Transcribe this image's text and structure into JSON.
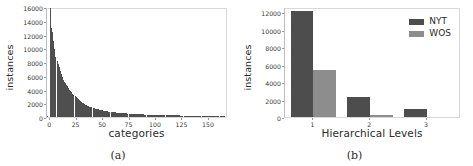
{
  "figure": {
    "background": "#ffffff",
    "subfigures": [
      {
        "caption": "(a)"
      },
      {
        "caption": "(b)"
      }
    ]
  },
  "colors": {
    "nyt": "#4d4d4d",
    "wos": "#8d8d8d",
    "histogram": "#4f4f4f",
    "axis": "#d8d8d8",
    "text": "#2b2b2b"
  },
  "chart_data": [
    {
      "type": "bar",
      "id": "category-instance-distribution",
      "title": "",
      "xlabel": "categories",
      "ylabel": "instances",
      "xlim": [
        -3,
        168
      ],
      "ylim": [
        0,
        16000
      ],
      "grid": false,
      "legend": null,
      "xticks": [
        "0",
        "25",
        "50",
        "75",
        "100",
        "125",
        "150"
      ],
      "xtick_values": [
        0,
        25,
        50,
        75,
        100,
        125,
        150
      ],
      "yticks": [
        "0",
        "2000",
        "4000",
        "6000",
        "8000",
        "10000",
        "12000",
        "14000",
        "16000"
      ],
      "ytick_values": [
        0,
        2000,
        4000,
        6000,
        8000,
        10000,
        12000,
        14000,
        16000
      ],
      "categories": [
        0,
        1,
        2,
        3,
        4,
        5,
        6,
        7,
        8,
        9,
        10,
        11,
        12,
        13,
        14,
        15,
        16,
        17,
        18,
        19,
        20,
        21,
        22,
        23,
        24,
        25,
        26,
        27,
        28,
        29,
        30,
        31,
        32,
        33,
        34,
        35,
        36,
        37,
        38,
        39,
        40,
        41,
        42,
        43,
        44,
        45,
        46,
        47,
        48,
        49,
        50,
        51,
        52,
        53,
        54,
        55,
        56,
        57,
        58,
        59,
        60,
        61,
        62,
        63,
        64,
        65,
        66,
        67,
        68,
        69,
        70,
        71,
        72,
        73,
        74,
        75,
        76,
        77,
        78,
        79,
        80,
        81,
        82,
        83,
        84,
        85,
        86,
        87,
        88,
        89,
        90,
        91,
        92,
        93,
        94,
        95,
        96,
        97,
        98,
        99,
        100,
        101,
        102,
        103,
        104,
        105,
        106,
        107,
        108,
        109,
        110,
        111,
        112,
        113,
        114,
        115,
        116,
        117,
        118,
        119,
        120,
        121,
        122,
        123,
        124,
        125,
        126,
        127,
        128,
        129,
        130,
        131,
        132,
        133,
        134,
        135,
        136,
        137,
        138,
        139,
        140,
        141,
        142,
        143,
        144,
        145,
        146,
        147,
        148,
        149,
        150,
        151,
        152,
        153,
        154,
        155,
        156,
        157,
        158,
        159,
        160,
        161,
        162,
        163,
        164
      ],
      "values": [
        15800,
        12950,
        12300,
        11100,
        9900,
        8800,
        8200,
        7700,
        7300,
        6700,
        6200,
        5750,
        5400,
        5100,
        4900,
        4700,
        4500,
        4250,
        4000,
        3800,
        3600,
        3400,
        3200,
        3050,
        2900,
        2750,
        2600,
        2450,
        2300,
        2200,
        2100,
        2000,
        1900,
        1800,
        1720,
        1650,
        1580,
        1510,
        1450,
        1390,
        1330,
        1280,
        1230,
        1180,
        1140,
        1100,
        1060,
        1020,
        990,
        960,
        930,
        900,
        870,
        845,
        820,
        795,
        770,
        750,
        730,
        710,
        690,
        672,
        655,
        638,
        622,
        607,
        592,
        578,
        564,
        551,
        538,
        526,
        514,
        502,
        491,
        480,
        470,
        460,
        450,
        441,
        432,
        423,
        414,
        406,
        398,
        390,
        383,
        376,
        369,
        362,
        355,
        349,
        343,
        337,
        331,
        325,
        320,
        315,
        310,
        305,
        300,
        295,
        290,
        286,
        282,
        278,
        274,
        270,
        266,
        262,
        258,
        255,
        252,
        249,
        246,
        243,
        240,
        237,
        234,
        231,
        228,
        225,
        222,
        220,
        218,
        216,
        214,
        212,
        210,
        208,
        206,
        204,
        202,
        200,
        198,
        196,
        194,
        192,
        190,
        188,
        186,
        184,
        182,
        180,
        178,
        176,
        174,
        172,
        170,
        168,
        166,
        164,
        162,
        160,
        158,
        156,
        154,
        152,
        150,
        148,
        146,
        144,
        142,
        140,
        138,
        136
      ]
    },
    {
      "type": "bar",
      "id": "hierarchical-levels-instances",
      "title": "",
      "xlabel": "Hierarchical Levels",
      "ylabel": "instances",
      "xlim": [
        0.5,
        3.6
      ],
      "ylim": [
        0,
        12600
      ],
      "grid": false,
      "legend": {
        "position": "upper right",
        "entries": [
          "NYT",
          "WOS"
        ]
      },
      "categories": [
        "1",
        "2",
        "3"
      ],
      "xticks": [
        "1",
        "2",
        "3"
      ],
      "yticks": [
        "0",
        "2000",
        "4000",
        "6000",
        "8000",
        "10000",
        "12000"
      ],
      "ytick_values": [
        0,
        2000,
        4000,
        6000,
        8000,
        10000,
        12000
      ],
      "series": [
        {
          "name": "NYT",
          "color": "#4d4d4d",
          "values": [
            12100,
            2300,
            900
          ]
        },
        {
          "name": "WOS",
          "color": "#8d8d8d",
          "values": [
            5350,
            250,
            0
          ]
        }
      ]
    }
  ]
}
